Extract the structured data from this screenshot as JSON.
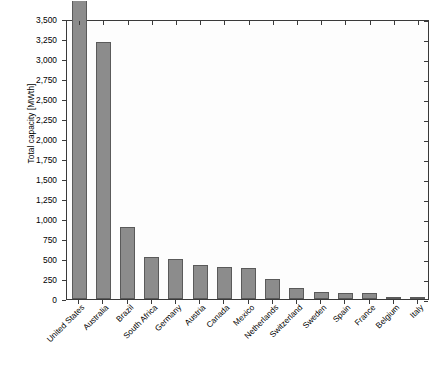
{
  "chart_data": {
    "type": "bar",
    "title": "",
    "xlabel": "",
    "ylabel": "Total capacity [MWth]",
    "ylim": [
      0,
      3500
    ],
    "ytick_step": 250,
    "grid": false,
    "legend": null,
    "bar_color": "#8c8c8c",
    "bar_edge_color": "#5a5a5a",
    "categories": [
      "United States",
      "Australia",
      "Brazil",
      "South Africa",
      "Germany",
      "Austria",
      "Canada",
      "Mexico",
      "Netherlands",
      "Switzerland",
      "Sweden",
      "Spain",
      "France",
      "Belgium",
      "Italy"
    ],
    "values": [
      12455.5,
      3210,
      900,
      520,
      500,
      425,
      400,
      390,
      255,
      140,
      90,
      80,
      75,
      25,
      20
    ],
    "clipped_bars": [
      {
        "index": 0,
        "label": "12,455.5",
        "note": "bar exceeds axis maximum and is truncated at the top of the plot"
      }
    ],
    "ytick_labels": [
      "0",
      "250",
      "500",
      "750",
      "1,000",
      "1,250",
      "1,500",
      "1,750",
      "2,000",
      "2,250",
      "2,500",
      "2,750",
      "3,000",
      "3,250",
      "3,500"
    ],
    "ytick_values": [
      0,
      250,
      500,
      750,
      1000,
      1250,
      1500,
      1750,
      2000,
      2250,
      2500,
      2750,
      3000,
      3250,
      3500
    ]
  }
}
